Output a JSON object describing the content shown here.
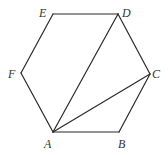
{
  "diagram": {
    "type": "regular-hexagon-with-diagonals",
    "vertices": [
      {
        "name": "A",
        "x": 53,
        "y": 132,
        "label_x": 44,
        "label_y": 148
      },
      {
        "name": "B",
        "x": 119,
        "y": 132,
        "label_x": 118,
        "label_y": 148
      },
      {
        "name": "C",
        "x": 150,
        "y": 74,
        "label_x": 152,
        "label_y": 78
      },
      {
        "name": "D",
        "x": 118,
        "y": 14,
        "label_x": 122,
        "label_y": 16
      },
      {
        "name": "E",
        "x": 53,
        "y": 14,
        "label_x": 38,
        "label_y": 16
      },
      {
        "name": "F",
        "x": 21,
        "y": 73,
        "label_x": 8,
        "label_y": 78
      }
    ],
    "edges": [
      [
        "A",
        "B"
      ],
      [
        "B",
        "C"
      ],
      [
        "C",
        "D"
      ],
      [
        "D",
        "E"
      ],
      [
        "E",
        "F"
      ],
      [
        "F",
        "A"
      ]
    ],
    "diagonals": [
      [
        "A",
        "D"
      ],
      [
        "A",
        "C"
      ]
    ],
    "labels": {
      "A": "A",
      "B": "B",
      "C": "C",
      "D": "D",
      "E": "E",
      "F": "F"
    },
    "colors": {
      "stroke": "#2a2a2a",
      "label": "#333333",
      "background": "#ffffff"
    }
  }
}
